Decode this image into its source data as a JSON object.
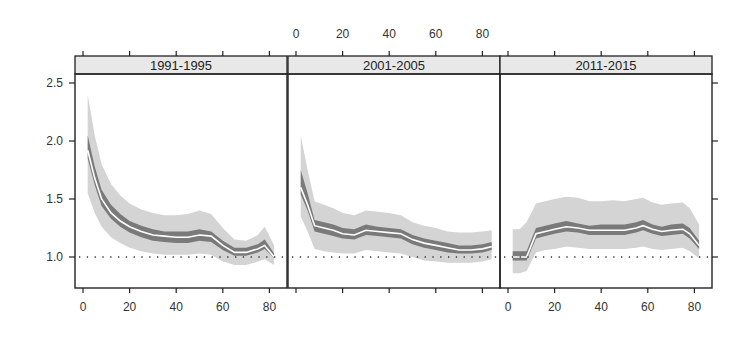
{
  "chart_data": {
    "type": "line",
    "layout": "lattice-3-panels",
    "title": "",
    "xlabel": "",
    "ylabel": "",
    "ylim": [
      0.73,
      2.58
    ],
    "xlim": [
      -3,
      88
    ],
    "y_ticks": [
      1.0,
      1.5,
      2.0,
      2.5
    ],
    "y_tick_labels": [
      "1.0",
      "1.5",
      "2.0",
      "2.5"
    ],
    "x_ticks": [
      0,
      20,
      40,
      60,
      80
    ],
    "x_tick_labels": [
      "0",
      "20",
      "40",
      "60",
      "80"
    ],
    "reference_line": {
      "y": 1.0,
      "style": "dotted"
    },
    "grid": false,
    "legend": null,
    "colors": {
      "outer_band": "#d4d4d4",
      "inner_band": "#7a7a7a",
      "center_line": "#ffffff",
      "strip_bg": "#e8e8e8",
      "axis": "#222222"
    },
    "panels": [
      {
        "label": "1991-1995",
        "x": [
          2,
          5,
          8,
          12,
          16,
          20,
          25,
          30,
          35,
          40,
          45,
          50,
          55,
          60,
          65,
          70,
          75,
          78,
          82
        ],
        "center": [
          1.92,
          1.68,
          1.5,
          1.38,
          1.31,
          1.26,
          1.22,
          1.19,
          1.18,
          1.17,
          1.17,
          1.19,
          1.18,
          1.1,
          1.04,
          1.04,
          1.07,
          1.1,
          1.0
        ],
        "inner_lo": [
          1.85,
          1.62,
          1.44,
          1.33,
          1.26,
          1.21,
          1.17,
          1.14,
          1.13,
          1.12,
          1.12,
          1.14,
          1.13,
          1.06,
          1.01,
          1.01,
          1.04,
          1.07,
          0.99
        ],
        "inner_hi": [
          2.05,
          1.78,
          1.58,
          1.45,
          1.37,
          1.31,
          1.27,
          1.24,
          1.22,
          1.22,
          1.22,
          1.24,
          1.22,
          1.14,
          1.08,
          1.08,
          1.11,
          1.15,
          1.03
        ],
        "outer_lo": [
          1.55,
          1.38,
          1.26,
          1.17,
          1.12,
          1.08,
          1.05,
          1.03,
          1.02,
          1.02,
          1.02,
          1.03,
          1.02,
          0.96,
          0.93,
          0.93,
          0.96,
          0.98,
          0.93
        ],
        "outer_hi": [
          2.4,
          2.05,
          1.8,
          1.63,
          1.53,
          1.46,
          1.41,
          1.38,
          1.36,
          1.36,
          1.37,
          1.4,
          1.37,
          1.25,
          1.15,
          1.14,
          1.19,
          1.26,
          1.1
        ]
      },
      {
        "label": "2001-2005",
        "x": [
          2,
          5,
          8,
          12,
          16,
          20,
          25,
          30,
          35,
          40,
          45,
          50,
          55,
          60,
          65,
          70,
          75,
          80,
          84
        ],
        "center": [
          1.6,
          1.45,
          1.27,
          1.25,
          1.23,
          1.2,
          1.19,
          1.23,
          1.22,
          1.21,
          1.2,
          1.15,
          1.12,
          1.1,
          1.08,
          1.06,
          1.06,
          1.07,
          1.09
        ],
        "inner_lo": [
          1.54,
          1.4,
          1.22,
          1.2,
          1.18,
          1.16,
          1.15,
          1.19,
          1.18,
          1.17,
          1.16,
          1.11,
          1.08,
          1.06,
          1.04,
          1.03,
          1.03,
          1.04,
          1.06
        ],
        "inner_hi": [
          1.75,
          1.55,
          1.32,
          1.3,
          1.28,
          1.25,
          1.24,
          1.28,
          1.26,
          1.25,
          1.24,
          1.19,
          1.16,
          1.14,
          1.12,
          1.1,
          1.1,
          1.11,
          1.13
        ],
        "outer_lo": [
          1.35,
          1.22,
          1.07,
          1.05,
          1.04,
          1.03,
          1.03,
          1.06,
          1.05,
          1.04,
          1.03,
          1.0,
          0.97,
          0.96,
          0.95,
          0.95,
          0.95,
          0.96,
          0.98
        ],
        "outer_hi": [
          2.05,
          1.75,
          1.48,
          1.45,
          1.42,
          1.38,
          1.36,
          1.4,
          1.39,
          1.38,
          1.36,
          1.3,
          1.27,
          1.25,
          1.22,
          1.21,
          1.21,
          1.22,
          1.23
        ]
      },
      {
        "label": "2011-2015",
        "x": [
          2,
          5,
          8,
          12,
          16,
          20,
          25,
          30,
          35,
          40,
          45,
          50,
          55,
          58,
          62,
          66,
          70,
          75,
          78,
          82
        ],
        "center": [
          1.0,
          1.0,
          1.0,
          1.2,
          1.22,
          1.24,
          1.26,
          1.25,
          1.23,
          1.23,
          1.23,
          1.23,
          1.25,
          1.27,
          1.24,
          1.22,
          1.23,
          1.24,
          1.2,
          1.1
        ],
        "inner_lo": [
          0.97,
          0.97,
          0.97,
          1.16,
          1.18,
          1.2,
          1.22,
          1.21,
          1.19,
          1.19,
          1.19,
          1.19,
          1.21,
          1.23,
          1.2,
          1.18,
          1.19,
          1.2,
          1.16,
          1.07
        ],
        "inner_hi": [
          1.05,
          1.05,
          1.05,
          1.25,
          1.27,
          1.29,
          1.31,
          1.29,
          1.27,
          1.28,
          1.28,
          1.28,
          1.3,
          1.32,
          1.28,
          1.26,
          1.28,
          1.29,
          1.25,
          1.14
        ],
        "outer_lo": [
          0.86,
          0.86,
          0.88,
          1.04,
          1.06,
          1.07,
          1.09,
          1.08,
          1.07,
          1.07,
          1.07,
          1.07,
          1.08,
          1.09,
          1.07,
          1.06,
          1.07,
          1.08,
          1.05,
          0.99
        ],
        "outer_hi": [
          1.24,
          1.24,
          1.3,
          1.46,
          1.48,
          1.5,
          1.52,
          1.51,
          1.48,
          1.48,
          1.49,
          1.48,
          1.5,
          1.51,
          1.47,
          1.45,
          1.46,
          1.47,
          1.42,
          1.28
        ]
      }
    ]
  }
}
